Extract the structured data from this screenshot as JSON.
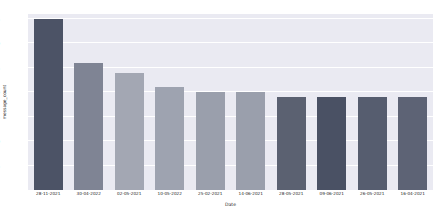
{
  "chart_data": {
    "type": "bar",
    "title": "",
    "xlabel": "Date",
    "ylabel": "message_count",
    "categories": [
      "28-11-2021",
      "30-04-2022",
      "02-05-2021",
      "10-05-2022",
      "25-02-2021",
      "14-06-2021",
      "28-05-2021",
      "09-06-2021",
      "26-05-2021",
      "16-04-2021"
    ],
    "values": [
      35,
      26,
      24,
      21,
      20,
      20,
      19,
      19,
      19,
      19
    ],
    "bar_colors": [
      "#4c5366",
      "#7f8494",
      "#a3a7b3",
      "#9ea3b0",
      "#9a9fac",
      "#9a9fac",
      "#5b6171",
      "#4a5164",
      "#565d6f",
      "#5d6375"
    ],
    "ylim": [
      0,
      36
    ],
    "yticks": [
      5,
      10,
      15,
      20,
      25,
      30,
      35
    ],
    "ytick_labels": [
      "5",
      "10",
      "15",
      "20",
      "25",
      "30",
      "35"
    ],
    "grid": true,
    "grid_color": "#ffffff",
    "plot_background": "#eaeaf2",
    "figure_background": "#ffffff",
    "legend": null
  }
}
